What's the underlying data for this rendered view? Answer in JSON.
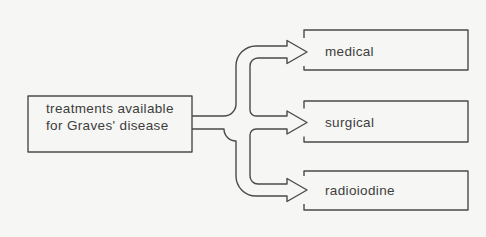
{
  "diagram": {
    "source": {
      "line1": "treatments available",
      "line2": "for Graves' disease"
    },
    "targets": [
      {
        "label": "medical"
      },
      {
        "label": "surgical"
      },
      {
        "label": "radioiodine"
      }
    ]
  },
  "colors": {
    "background": "#f6f6f4",
    "line": "#4a4a4a",
    "text": "#3d3d3d"
  }
}
